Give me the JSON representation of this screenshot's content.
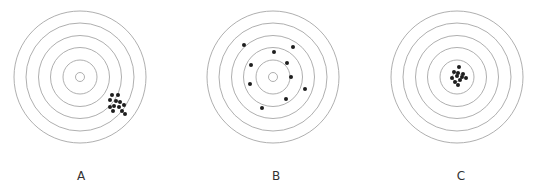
{
  "figure": {
    "ring_color": "#9a9a9a",
    "dot_color": "#1e1e1e",
    "ring_radii": [
      66,
      54,
      41.5,
      29.5,
      17,
      4.5
    ],
    "dot_radius": 2,
    "targets": [
      {
        "label": "A",
        "center": [
          80,
          77
        ],
        "label_pos": [
          81,
          180
        ],
        "shots": [
          [
            112,
            95
          ],
          [
            118,
            95
          ],
          [
            110,
            100
          ],
          [
            116,
            101
          ],
          [
            120,
            102
          ],
          [
            110,
            107
          ],
          [
            114,
            106
          ],
          [
            119,
            107
          ],
          [
            124,
            105
          ],
          [
            113,
            111
          ],
          [
            122,
            111
          ],
          [
            125,
            114
          ]
        ]
      },
      {
        "label": "B",
        "center": [
          273,
          77
        ],
        "label_pos": [
          276,
          180
        ],
        "shots": [
          [
            244,
            45
          ],
          [
            274,
            52
          ],
          [
            293,
            47
          ],
          [
            251,
            65
          ],
          [
            287,
            63
          ],
          [
            291,
            77
          ],
          [
            250,
            84
          ],
          [
            305,
            89
          ],
          [
            286,
            99
          ],
          [
            262,
            108
          ]
        ]
      },
      {
        "label": "C",
        "center": [
          457,
          77
        ],
        "label_pos": [
          461,
          180
        ],
        "shots": [
          [
            459,
            67
          ],
          [
            454,
            72
          ],
          [
            458,
            73
          ],
          [
            463,
            74
          ],
          [
            457,
            76
          ],
          [
            462,
            77
          ],
          [
            466,
            78
          ],
          [
            452,
            78
          ],
          [
            460,
            80
          ],
          [
            455,
            82
          ],
          [
            458,
            85
          ]
        ]
      }
    ]
  }
}
